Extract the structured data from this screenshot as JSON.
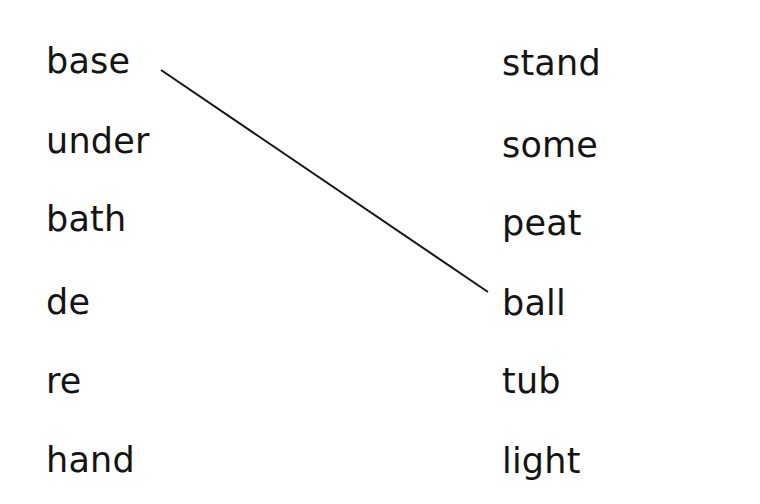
{
  "left_words": [
    "base",
    "under",
    "bath",
    "de",
    "re",
    "hand"
  ],
  "right_words": [
    "stand",
    "some",
    "peat",
    "ball",
    "tub",
    "light"
  ],
  "connections": [
    {
      "from": "base",
      "to": "ball"
    }
  ]
}
